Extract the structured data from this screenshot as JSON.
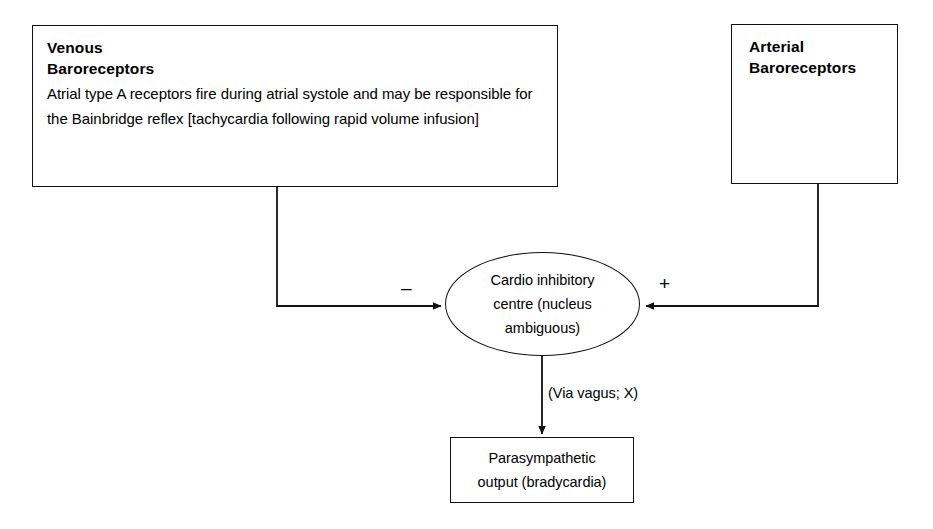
{
  "diagram": {
    "background_color": "#ffffff",
    "stroke_color": "#111111",
    "text_color": "#000000"
  },
  "nodes": {
    "venous": {
      "title": "Venous\nBaroreceptors",
      "body": "Atrial type A receptors fire during atrial systole and may be responsible for the Bainbridge reflex [tachycardia following rapid volume infusion]"
    },
    "arterial": {
      "title": "Arterial\nBaroreceptors"
    },
    "centre": {
      "label": "Cardio inhibitory\ncentre (nucleus\nambiguous)"
    },
    "output": {
      "line1": "Parasympathetic",
      "line2": "output (bradycardia)"
    }
  },
  "edges": {
    "venous_to_centre": {
      "sign": "–",
      "sign_name": "minus",
      "from": "venous",
      "to": "centre"
    },
    "arterial_to_centre": {
      "sign": "+",
      "sign_name": "plus",
      "from": "arterial",
      "to": "centre"
    },
    "centre_to_output": {
      "label": "(Via vagus; X)",
      "from": "centre",
      "to": "output"
    }
  }
}
